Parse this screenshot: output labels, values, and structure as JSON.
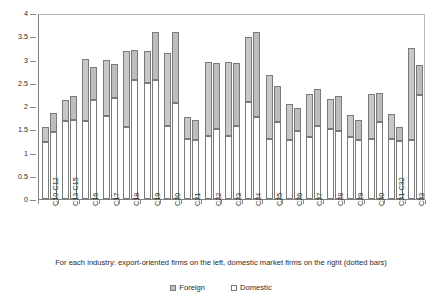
{
  "caption": "For each industry: export-oriented firms on the left, domestic market firms on the right (dotted bars)",
  "legend": {
    "foreign_label": "Foreign",
    "domestic_label": "Domestic"
  },
  "axis": {
    "y_ticks": [
      "0",
      "0.5",
      "1",
      "1.5",
      "2",
      "2.5",
      "3",
      "3.5",
      "4"
    ]
  },
  "chart_data": {
    "type": "bar",
    "title": "",
    "subtitle": "",
    "xlabel": "For each industry: export-oriented firms on the left, domestic market firms on the right (dotted bars)",
    "ylabel": "",
    "ylim": [
      0,
      4
    ],
    "ytick_values": [
      0,
      0.5,
      1,
      1.5,
      2,
      2.5,
      3,
      3.5,
      4
    ],
    "grid": false,
    "legend": [
      "Foreign",
      "Domestic"
    ],
    "legend_position": "bottom-center",
    "note": "Grouped stacked bars. Each industry has two bars: left = export-oriented firms (plain fill), right = domestic market firms (dotted fill). Each bar is stacked: lower segment = Domestic component, upper segment = Foreign component. Totals are bar tops.",
    "categories": [
      "C10-C12",
      "C13-C15",
      "C16",
      "C17",
      "C18",
      "C19",
      "C20",
      "C21",
      "C22",
      "C23",
      "C24",
      "C25",
      "C26",
      "C27",
      "C28",
      "C29",
      "C30",
      "C31-C32",
      "C33"
    ],
    "series": [
      {
        "name": "Export-oriented (left bar) - Domestic segment",
        "values": [
          1.22,
          1.68,
          1.68,
          1.78,
          1.55,
          2.49,
          1.58,
          1.3,
          1.35,
          1.35,
          2.08,
          1.3,
          1.27,
          1.33,
          1.5,
          1.34,
          1.3,
          1.3,
          1.27
        ]
      },
      {
        "name": "Export-oriented (left bar) - Foreign segment",
        "values": [
          0.33,
          0.44,
          1.33,
          1.22,
          1.63,
          0.7,
          1.57,
          0.47,
          1.6,
          1.59,
          1.4,
          1.37,
          0.78,
          0.92,
          0.65,
          0.47,
          0.96,
          0.53,
          1.98
        ]
      },
      {
        "name": "Export-oriented (left bar) - total",
        "values": [
          1.55,
          2.12,
          3.01,
          3.0,
          3.18,
          3.19,
          3.15,
          1.77,
          2.95,
          2.94,
          3.48,
          2.67,
          2.05,
          2.25,
          2.15,
          1.81,
          2.26,
          1.83,
          3.25
        ]
      },
      {
        "name": "Domestic market (right bar, dotted) - Domestic segment",
        "values": [
          1.44,
          1.7,
          2.14,
          2.18,
          2.56,
          2.56,
          2.07,
          1.26,
          1.5,
          1.58,
          1.76,
          1.66,
          1.47,
          1.57,
          1.46,
          1.27,
          1.66,
          1.25,
          2.24
        ]
      },
      {
        "name": "Domestic market (right bar, dotted) - Foreign segment",
        "values": [
          0.41,
          0.52,
          0.69,
          0.73,
          0.64,
          1.04,
          1.52,
          0.44,
          1.43,
          1.35,
          1.83,
          0.76,
          0.48,
          0.8,
          0.76,
          0.43,
          0.63,
          0.3,
          0.64
        ]
      },
      {
        "name": "Domestic market (right bar, dotted) - total",
        "values": [
          1.85,
          2.22,
          2.83,
          2.91,
          3.2,
          3.6,
          3.59,
          1.7,
          2.93,
          2.93,
          3.59,
          2.42,
          1.95,
          2.37,
          2.22,
          1.7,
          2.29,
          1.55,
          2.88
        ]
      }
    ]
  }
}
